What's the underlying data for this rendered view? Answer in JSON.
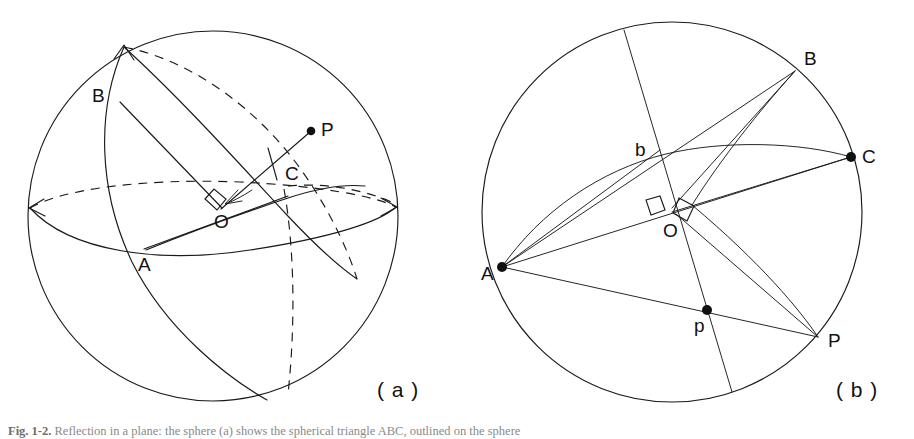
{
  "figure": {
    "background_color": "#ffffff",
    "ink_color": "#1a1a1a",
    "width": 914,
    "height": 439
  },
  "panels": [
    {
      "id": "a",
      "label": "( a )",
      "caption_role": "sphere with spherical triangle ABC and pole P",
      "center": {
        "x": 213,
        "y": 216
      },
      "radius": 185,
      "points": [
        {
          "name": "A",
          "label": "A",
          "x": 144,
          "y": 249,
          "dot": false,
          "label_dx": -6,
          "label_dy": 22
        },
        {
          "name": "B",
          "label": "B",
          "x": 110,
          "y": 99,
          "dot": false,
          "label_dx": -16,
          "label_dy": -3
        },
        {
          "name": "C",
          "label": "C",
          "x": 279,
          "y": 172,
          "dot": false,
          "label_dx": 6,
          "label_dy": 8
        },
        {
          "name": "O",
          "label": "O",
          "x": 220,
          "y": 206,
          "dot": false,
          "label_dx": -6,
          "label_dy": 22
        },
        {
          "name": "P",
          "label": "P",
          "x": 314,
          "y": 130,
          "dot": true,
          "label_dx": 7,
          "label_dy": 6
        }
      ]
    },
    {
      "id": "b",
      "label": "( b )",
      "caption_role": "plane projection of the sphere with points A B b C O p P",
      "center": {
        "x": 672,
        "y": 212
      },
      "radius": 190,
      "points": [
        {
          "name": "A",
          "label": "A",
          "x": 502,
          "y": 267,
          "dot": true,
          "label_dx": -21,
          "label_dy": 8
        },
        {
          "name": "B",
          "label": "B",
          "x": 795,
          "y": 70,
          "dot": false,
          "label_dx": 9,
          "label_dy": -5
        },
        {
          "name": "b",
          "label": "b",
          "x": 653,
          "y": 157,
          "dot": false,
          "label_dx": -18,
          "label_dy": -2
        },
        {
          "name": "C",
          "label": "C",
          "x": 851,
          "y": 157,
          "dot": true,
          "label_dx": 11,
          "label_dy": 6
        },
        {
          "name": "O",
          "label": "O",
          "x": 672,
          "y": 212,
          "dot": false,
          "label_dx": -9,
          "label_dy": 25
        },
        {
          "name": "p",
          "label": "p",
          "x": 707,
          "y": 310,
          "dot": true,
          "label_dx": -13,
          "label_dy": 22
        },
        {
          "name": "P",
          "label": "P",
          "x": 818,
          "y": 337,
          "dot": false,
          "label_dx": 10,
          "label_dy": 10
        }
      ]
    }
  ],
  "annotations": {
    "right_angle_marks": [
      {
        "panel": "a",
        "at": "O",
        "count": 1
      },
      {
        "panel": "b",
        "at": "O",
        "count": 2
      }
    ],
    "arrow_heads": [
      {
        "panel": "a",
        "at": "top-of-sphere"
      },
      {
        "panel": "a",
        "at": "equator-left"
      },
      {
        "panel": "a",
        "at": "equator-right"
      },
      {
        "panel": "a",
        "at": "toward-O"
      }
    ],
    "dashed_curves_panel_a": 3
  },
  "caption": {
    "prefix": "Fig. 1-2.",
    "text": "Reflection in a plane: the sphere (a) shows the spherical triangle ABC, outlined on the sphere"
  }
}
